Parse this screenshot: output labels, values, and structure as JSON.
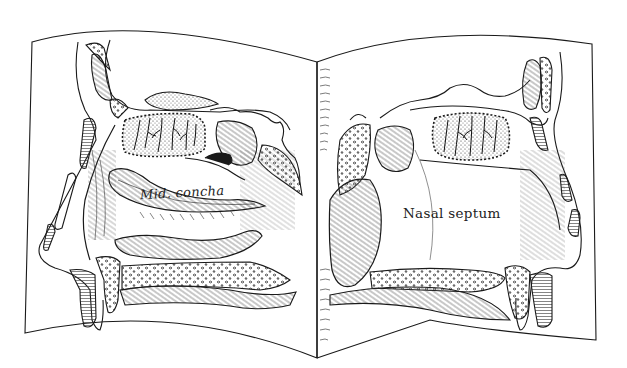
{
  "illustration": {
    "subject": "Open book showing two sagittal sections of the nasal cavity",
    "left_page": {
      "view": "lateral nasal wall",
      "label": "Mid. concha"
    },
    "right_page": {
      "view": "nasal septum",
      "label": "Nasal septum"
    },
    "style": "black ink line drawing with hatching and stippling",
    "colors": {
      "ink": "#1a1a1a",
      "paper": "#ffffff"
    }
  }
}
